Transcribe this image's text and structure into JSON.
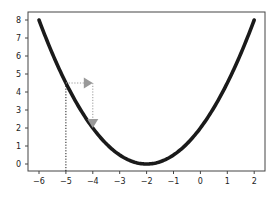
{
  "chart_data": {
    "type": "line",
    "title": "",
    "xlabel": "",
    "ylabel": "",
    "xlim": [
      -6.4,
      2.4
    ],
    "ylim": [
      -0.4,
      8.4
    ],
    "grid": false,
    "legend": null,
    "x_ticks": [
      -6,
      -5,
      -4,
      -3,
      -2,
      -1,
      0,
      1,
      2
    ],
    "y_ticks": [
      0,
      1,
      2,
      3,
      4,
      5,
      6,
      7,
      8
    ],
    "x_tick_labels": [
      "−6",
      "−5",
      "−4",
      "−3",
      "−2",
      "−1",
      "0",
      "1",
      "2"
    ],
    "y_tick_labels": [
      "0",
      "1",
      "2",
      "3",
      "4",
      "5",
      "6",
      "7",
      "8"
    ],
    "series": [
      {
        "name": "f(x) = 0.5(x+2)^2",
        "color": "#1a1a1a",
        "x": [
          -6,
          -5.5,
          -5,
          -4.5,
          -4,
          -3.5,
          -3,
          -2.5,
          -2,
          -1.5,
          -1,
          -0.5,
          0,
          0.5,
          1,
          1.5,
          2
        ],
        "y": [
          8,
          6.125,
          4.5,
          3.125,
          2,
          1.125,
          0.5,
          0.125,
          0,
          0.125,
          0.5,
          1.125,
          2,
          3.125,
          4.5,
          6.125,
          8
        ]
      }
    ],
    "annotations": [
      {
        "type": "vline-dotted",
        "x": -5,
        "y_from": 0,
        "y_to": 4.5,
        "color": "#1a1a1a"
      },
      {
        "type": "arrow-dotted",
        "from": [
          -5,
          4.5
        ],
        "to": [
          -4,
          4.5
        ],
        "color": "#999999",
        "label": "step in x"
      },
      {
        "type": "arrow-dotted",
        "from": [
          -4,
          4.5
        ],
        "to": [
          -4,
          2
        ],
        "color": "#999999",
        "label": "descend to f(x)"
      }
    ]
  },
  "colors": {
    "curve": "#1a1a1a",
    "arrow": "#9a9a9a",
    "axes": "#444444",
    "background": "#ffffff"
  }
}
